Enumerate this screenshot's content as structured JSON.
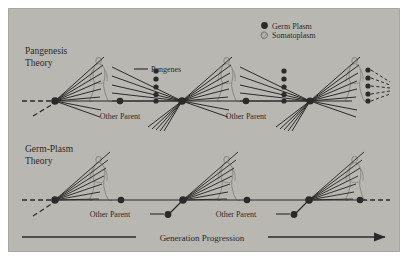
{
  "figure": {
    "panel_bg": "#b9b7b2",
    "ink": "#2b2a28",
    "outline": "#8e8c87",
    "page_bg": "#ffffff"
  },
  "legend": {
    "items": [
      {
        "key": "germ-plasm",
        "label": "Germ Plasm",
        "marker": "filled-circle",
        "color": "#2b2a28"
      },
      {
        "key": "somatoplasm",
        "label": "Somatoplasm",
        "marker": "hatched-outline",
        "color": "#8e8c87"
      }
    ]
  },
  "rows": [
    {
      "key": "pangenesis",
      "title_line1": "Pangenesis",
      "title_line2": "Theory",
      "baseline_y": 101,
      "callout": {
        "label": "Pangenes",
        "x": 151,
        "y": 72
      },
      "other_parent_labels": [
        {
          "label": "Other Parent",
          "x": 120,
          "y": 119
        },
        {
          "label": "Other Parent",
          "x": 246,
          "y": 119
        }
      ]
    },
    {
      "key": "germ-plasm",
      "title_line1": "Germ-Plasm",
      "title_line2": "Theory",
      "baseline_y": 200,
      "other_parent_labels": [
        {
          "label": "Other Parent",
          "x": 121,
          "y": 215
        },
        {
          "label": "Other Parent",
          "x": 247,
          "y": 215
        }
      ]
    }
  ],
  "axis": {
    "label": "Generation Progression",
    "y": 237,
    "x_start": 22,
    "x_end": 389
  },
  "generations": {
    "pangenesis_nodes_x": [
      55,
      120,
      182,
      246,
      310
    ],
    "germplasm_nodes_x": [
      55,
      121,
      183,
      247,
      309
    ],
    "figure_x": [
      96,
      224,
      352
    ]
  }
}
